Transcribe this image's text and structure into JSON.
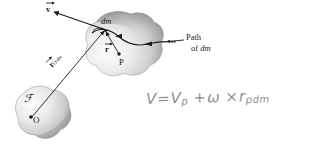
{
  "figure": {
    "type": "mechanics-diagram",
    "title_text": "",
    "background_color": "#ffffff",
    "ink_color": "#1b1b1b",
    "body_fill_light": "#f2f2f2",
    "body_fill_dark": "#8f8f8f",
    "handwriting_color": "#7c7c7c"
  },
  "labels": {
    "velocity_vector": "v",
    "mass_element": "dm",
    "position_vector": "r",
    "point_p": "P",
    "path_line1": "Path",
    "path_line2_prefix": "of ",
    "path_line2_italic": "dm",
    "r_o_dm_symbol": "r",
    "r_o_dm_subscript": "O/dm",
    "reference_frame": "ℱ",
    "origin_point": "O"
  },
  "handwriting": {
    "equation_full": "V = Vp + ω × rpdm",
    "lhs": "V",
    "equals": "=",
    "term1_symbol": "V",
    "term1_sub": "p",
    "plus": "+",
    "omega": "ω",
    "cross": "×",
    "term2_symbol": "r",
    "term2_sub": "pdm"
  },
  "geometry": {
    "upper_body_center": [
      122,
      46
    ],
    "lower_body_center": [
      45,
      112
    ],
    "dm_point": [
      105,
      30
    ],
    "p_point": [
      118,
      54
    ],
    "origin_point": [
      31,
      117
    ],
    "velocity_arrow_tip": [
      53,
      11
    ]
  }
}
